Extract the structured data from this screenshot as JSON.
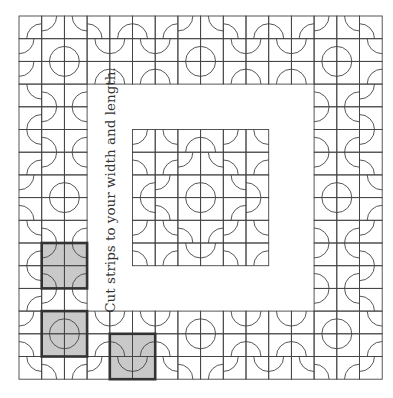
{
  "caption": "Cut strips to your width and length.",
  "grid": {
    "origin": [
      19,
      16
    ],
    "size": 16,
    "cell": 22.7,
    "arc_radius_ratio": 0.66,
    "line_color": "#444444",
    "white_region": {
      "row_start": 3,
      "row_end": 12,
      "col_start": 3,
      "col_end": 12
    },
    "inner_block": {
      "row_start": 5,
      "row_end": 10,
      "col_start": 5,
      "col_end": 10
    }
  },
  "highlight": {
    "fill": "#c9c9c9",
    "border": "#333333",
    "squares": [
      {
        "row": 10,
        "col": 1,
        "span": 2
      },
      {
        "row": 13,
        "col": 1,
        "span": 2
      },
      {
        "row": 14,
        "col": 4,
        "span": 2
      }
    ]
  },
  "cells": {
    "0": [
      "BR",
      "TL",
      "TR",
      "BL",
      "BR",
      "BL",
      "BR",
      "TL",
      "TR",
      "BL",
      "BR",
      "BL",
      "BR",
      "TL",
      "TR",
      "BL"
    ],
    "1": [
      "TL",
      "BR",
      "BL",
      "TR",
      "TL",
      "TR",
      "TL",
      "BR",
      "BL",
      "TR",
      "TL",
      "TR",
      "TL",
      "BR",
      "BL",
      "TR"
    ],
    "2": [
      "TL",
      "TR",
      "TL",
      "BR",
      "BL",
      "BR",
      "BL",
      "TR",
      "TL",
      "BR",
      "BL",
      "BR",
      "BL",
      "TR",
      "TL",
      "BR"
    ],
    "3": [
      "TR",
      "BL",
      "BR",
      "",
      "",
      "",
      "",
      "",
      "",
      "",
      "",
      "",
      "",
      "BL",
      "BR",
      "TL"
    ],
    "4": [
      "BR",
      "TL",
      "TR",
      "",
      "",
      "",
      "",
      "",
      "",
      "",
      "",
      "",
      "",
      "TL",
      "TR",
      "BL"
    ],
    "5": [
      "TR",
      "BL",
      "BR",
      "",
      "",
      "TL",
      "TR",
      "BR",
      "BL",
      "TL",
      "TR",
      "",
      "",
      "BL",
      "BR",
      "TL"
    ],
    "6": [
      "BR",
      "TL",
      "TR",
      "",
      "",
      "BL",
      "BR",
      "TL",
      "TR",
      "BL",
      "BR",
      "",
      "",
      "TL",
      "TR",
      "BL"
    ],
    "7": [
      "TL",
      "BR",
      "BL",
      "",
      "",
      "BR",
      "TL",
      "BR",
      "BL",
      "TR",
      "BL",
      "",
      "",
      "BR",
      "BL",
      "TR"
    ],
    "8": [
      "BL",
      "TR",
      "TL",
      "",
      "",
      "TR",
      "BL",
      "TR",
      "TL",
      "BR",
      "TL",
      "",
      "",
      "TR",
      "TL",
      "BR"
    ],
    "9": [
      "TR",
      "BL",
      "BR",
      "",
      "",
      "TL",
      "TR",
      "BL",
      "BR",
      "TL",
      "TR",
      "",
      "",
      "BL",
      "BR",
      "TL"
    ],
    "10": [
      "BR",
      "TL",
      "TR",
      "",
      "",
      "BL",
      "BR",
      "TR",
      "TL",
      "BL",
      "BR",
      "",
      "",
      "TL",
      "TR",
      "BL"
    ],
    "11": [
      "TR",
      "BL",
      "BR",
      "",
      "",
      "",
      "",
      "",
      "",
      "",
      "",
      "",
      "",
      "BL",
      "BR",
      "TL"
    ],
    "12": [
      "BR",
      "TL",
      "TR",
      "",
      "",
      "",
      "",
      "",
      "",
      "",
      "",
      "",
      "",
      "TL",
      "TR",
      "BL"
    ],
    "13": [
      "TL",
      "BR",
      "BL",
      "TR",
      "TL",
      "TR",
      "TL",
      "BR",
      "BL",
      "TR",
      "TL",
      "TR",
      "TL",
      "BR",
      "BL",
      "TR"
    ],
    "14": [
      "BL",
      "TR",
      "TL",
      "BR",
      "BL",
      "BR",
      "BL",
      "TR",
      "TL",
      "BR",
      "BL",
      "BR",
      "BL",
      "TR",
      "TL",
      "BR"
    ],
    "15": [
      "TR",
      "BL",
      "BR",
      "TL",
      "TR",
      "TL",
      "TR",
      "BL",
      "BR",
      "TL",
      "TR",
      "TL",
      "TR",
      "BL",
      "BR",
      "TL"
    ]
  }
}
